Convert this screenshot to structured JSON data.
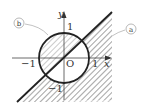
{
  "diagram": {
    "type": "region-graph",
    "axes": {
      "x_label": "x",
      "y_label": "y",
      "origin_label": "O",
      "x_ticks": [
        {
          "value": -1,
          "label": "−1"
        },
        {
          "value": 1,
          "label": "1"
        }
      ],
      "y_ticks": [
        {
          "value": 1,
          "label": "1"
        },
        {
          "value": -1,
          "label": "−1"
        }
      ]
    },
    "curves": [
      {
        "id": "a",
        "label": "a",
        "description": "line y = x"
      },
      {
        "id": "b",
        "label": "b",
        "description": "circle x^2 + y^2 = 1"
      }
    ],
    "shaded_regions": [
      "inside circle, above line y = x",
      "outside circle, below line y = x"
    ],
    "colors": {
      "stroke": "#222222",
      "hatch": "#8a8a8a",
      "label_circle": "#999999",
      "text": "#333333"
    }
  }
}
